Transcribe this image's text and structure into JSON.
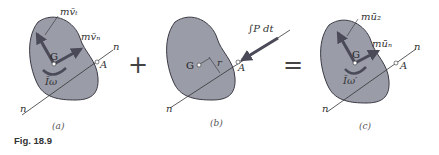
{
  "figure": {
    "caption": "Fig. 18.9",
    "colors": {
      "body_fill": "#9a9ca8",
      "body_stroke": "#3a3a44",
      "arrow": "#4a4a58",
      "line": "#333333"
    },
    "operators": {
      "plus": "+",
      "equals": "="
    },
    "panels": [
      {
        "id": "a",
        "sublabel": "(a)",
        "labels": {
          "G": "G",
          "A": "A",
          "n_top": "n",
          "n_bottom": "n",
          "vt": "mv̄ₜ",
          "vn": "mv̄ₙ",
          "couple": "Īω"
        }
      },
      {
        "id": "b",
        "sublabel": "(b)",
        "labels": {
          "G": "G",
          "A": "A",
          "r": "r",
          "n_bottom": "n",
          "impulse": "∫P dt"
        }
      },
      {
        "id": "c",
        "sublabel": "(c)",
        "labels": {
          "G": "G",
          "A": "A",
          "n_top": "n",
          "n_bottom": "n",
          "ut": "mū₂",
          "un": "mūₙ",
          "couple": "Īω′"
        }
      }
    ]
  }
}
